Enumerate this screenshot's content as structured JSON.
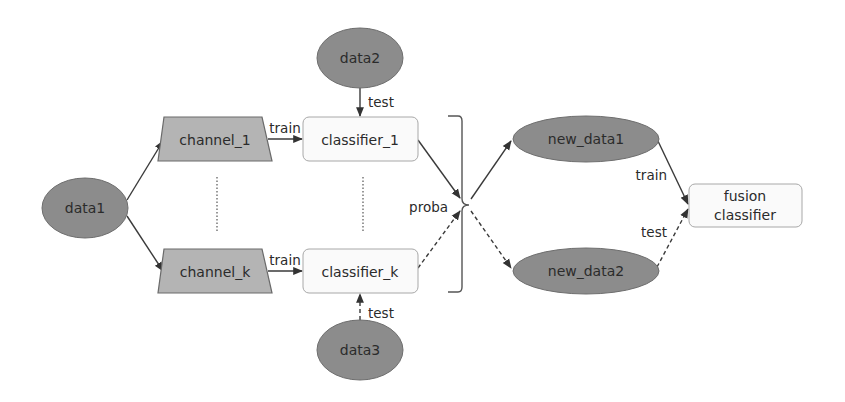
{
  "diagram": {
    "colors": {
      "data_fill": "#8c8c8c",
      "data_stroke": "#6e6e6e",
      "channel_fill": "#b4b4b4",
      "channel_stroke": "#6a6a6a",
      "classifier_fill": "#fafafa",
      "classifier_stroke": "#a8a8a8",
      "edge": "#3a3a3a"
    },
    "nodes": {
      "data1": {
        "label": "data1",
        "shape": "ellipse"
      },
      "data2": {
        "label": "data2",
        "shape": "ellipse"
      },
      "data3": {
        "label": "data3",
        "shape": "ellipse"
      },
      "channel_1": {
        "label": "channel_1",
        "shape": "trapezoid"
      },
      "channel_k": {
        "label": "channel_k",
        "shape": "trapezoid"
      },
      "classifier_1": {
        "label": "classifier_1",
        "shape": "rounded-rect"
      },
      "classifier_k": {
        "label": "classifier_k",
        "shape": "rounded-rect"
      },
      "new_data1": {
        "label": "new_data1",
        "shape": "ellipse"
      },
      "new_data2": {
        "label": "new_data2",
        "shape": "ellipse"
      },
      "fusion_classifier": {
        "label_line1": "fusion",
        "label_line2": "classifier",
        "shape": "rounded-rect"
      }
    },
    "edge_labels": {
      "channel1_to_classifier1": "train",
      "channelk_to_classifierk": "train",
      "data2_to_classifier1": "test",
      "data3_to_classifierk": "test",
      "brace_label": "proba",
      "newdata1_to_fusion": "train",
      "newdata2_to_fusion": "test"
    },
    "edges": [
      {
        "from": "data1",
        "to": "channel_1",
        "style": "solid"
      },
      {
        "from": "data1",
        "to": "channel_k",
        "style": "solid"
      },
      {
        "from": "channel_1",
        "to": "classifier_1",
        "style": "solid",
        "label": "train"
      },
      {
        "from": "channel_k",
        "to": "classifier_k",
        "style": "solid",
        "label": "train"
      },
      {
        "from": "data2",
        "to": "classifier_1",
        "style": "solid",
        "label": "test"
      },
      {
        "from": "data3",
        "to": "classifier_k",
        "style": "dashed",
        "label": "test"
      },
      {
        "from": "classifier_1",
        "to": "proba",
        "style": "solid"
      },
      {
        "from": "classifier_k",
        "to": "proba",
        "style": "dashed"
      },
      {
        "from": "proba",
        "to": "new_data1",
        "style": "solid"
      },
      {
        "from": "proba",
        "to": "new_data2",
        "style": "dashed"
      },
      {
        "from": "new_data1",
        "to": "fusion_classifier",
        "style": "solid",
        "label": "train"
      },
      {
        "from": "new_data2",
        "to": "fusion_classifier",
        "style": "dashed",
        "label": "test"
      }
    ]
  }
}
